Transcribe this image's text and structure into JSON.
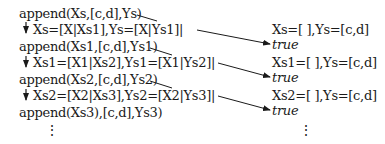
{
  "diagram": {
    "goals": [
      "append(Xs,[c,d],Ys)",
      "append(Xs1,[c,d],Ys1)",
      "append(Xs2,[c,d],Ys2)",
      "append(Xs3),[c,d],Ys3)"
    ],
    "unifications": [
      "Xs=[X|Xs1],Ys=[X|Ys1]|",
      "Xs1=[X1|Xs2],Ys1=[X1|Ys2]|",
      "Xs2=[X2|Xs3],Ys2=[X2|Ys3]|"
    ],
    "base_cases": [
      "Xs=[ ],Ys=[c,d]",
      "Xs1=[ ],Ys=[c,d]",
      "Xs2=[ ],Ys=[c,d]"
    ],
    "results": [
      "true",
      "true",
      "true"
    ],
    "continuation": "⋮",
    "colors": {
      "text": "#1a1a1a",
      "arrow": "#1a1a1a",
      "background": "#ffffff"
    }
  }
}
